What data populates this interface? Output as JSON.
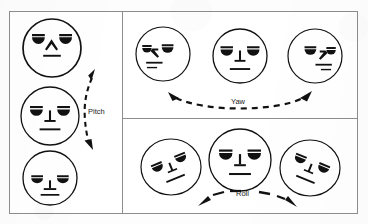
{
  "figure": {
    "background_color": "#fdfdfd",
    "ink_color": "#111111",
    "border_color": "#8d8d8d"
  },
  "panels": [
    {
      "id": "pitch",
      "name": "Pitch panel",
      "axis_label": "Pitch",
      "arrow_style": "dashed double-headed curved arrow",
      "arrow_orientation": "vertical",
      "faces": [
        {
          "id": "pitch-up",
          "pose": "looking up",
          "yaw_deg": 0,
          "pitch_deg": 30,
          "roll_deg": 0
        },
        {
          "id": "pitch-center",
          "pose": "frontal neutral",
          "yaw_deg": 0,
          "pitch_deg": 0,
          "roll_deg": 0
        },
        {
          "id": "pitch-down",
          "pose": "looking down",
          "yaw_deg": 0,
          "pitch_deg": -30,
          "roll_deg": 0
        }
      ]
    },
    {
      "id": "yaw",
      "name": "Yaw panel",
      "axis_label": "Yaw",
      "arrow_style": "dashed double-headed curved arrow",
      "arrow_orientation": "horizontal",
      "faces": [
        {
          "id": "yaw-left",
          "pose": "turned left",
          "yaw_deg": -45,
          "pitch_deg": 0,
          "roll_deg": 0
        },
        {
          "id": "yaw-center",
          "pose": "frontal neutral",
          "yaw_deg": 0,
          "pitch_deg": 0,
          "roll_deg": 0
        },
        {
          "id": "yaw-right",
          "pose": "turned right",
          "yaw_deg": 45,
          "pitch_deg": 0,
          "roll_deg": 0
        }
      ]
    },
    {
      "id": "roll",
      "name": "Roll panel",
      "axis_label": "Roll",
      "arrow_style": "dashed double-headed arrow",
      "arrow_orientation": "horizontal",
      "faces": [
        {
          "id": "roll-left",
          "pose": "tilted counter-clockwise",
          "yaw_deg": 0,
          "pitch_deg": 0,
          "roll_deg": -25
        },
        {
          "id": "roll-center",
          "pose": "frontal neutral",
          "yaw_deg": 0,
          "pitch_deg": 0,
          "roll_deg": 0
        },
        {
          "id": "roll-right",
          "pose": "tilted clockwise",
          "yaw_deg": 0,
          "pitch_deg": 0,
          "roll_deg": 25
        }
      ]
    }
  ]
}
